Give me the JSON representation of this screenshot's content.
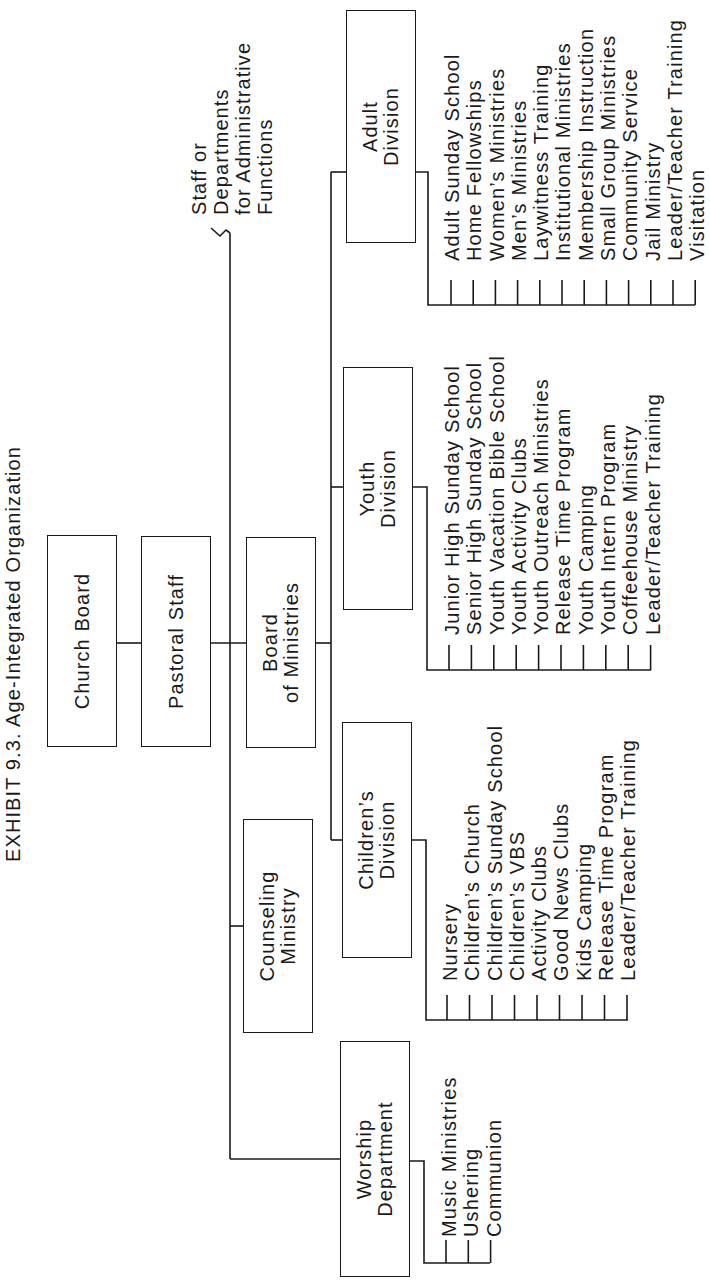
{
  "title": "EXHIBIT 9.3.  Age-Integrated Organization",
  "nodes": {
    "church_board": {
      "label": "Church Board"
    },
    "pastoral_staff": {
      "label": "Pastoral Staff"
    },
    "board_of_ministries": {
      "label": "Board\nof Ministries"
    },
    "staff_note": {
      "lines": [
        "Staff or",
        "Departments",
        "for Administrative",
        "Functions"
      ]
    },
    "counseling_ministry": {
      "label": "Counseling\nMinistry"
    },
    "worship_department": {
      "label": "Worship\nDepartment"
    },
    "childrens_division": {
      "label": "Children’s\nDivision"
    },
    "youth_division": {
      "label": "Youth\nDivision"
    },
    "adult_division": {
      "label": "Adult\nDivision"
    }
  },
  "lists": {
    "worship": [
      "Music Ministries",
      "Ushering",
      "Communion"
    ],
    "childrens": [
      "Nursery",
      "Children’s Church",
      "Children’s Sunday School",
      "Children’s VBS",
      "Activity Clubs",
      "Good News Clubs",
      "Kids Camping",
      "Release Time Program",
      "Leader/Teacher Training"
    ],
    "youth": [
      "Junior High Sunday School",
      "Senior High Sunday School",
      "Youth Vacation Bible School",
      "Youth Activity Clubs",
      "Youth Outreach Ministries",
      "Release Time Program",
      "Youth Camping",
      "Youth Intern Program",
      "Coffeehouse Ministry",
      "Leader/Teacher Training"
    ],
    "adult": [
      "Adult Sunday School",
      "Home Fellowships",
      "Women’s Ministries",
      "Men’s Ministries",
      "Laywitness Training",
      "Institutional Ministries",
      "Membership Instruction",
      "Small Group Ministries",
      "Community Service",
      "Jail Ministry",
      "Leader/Teacher Training",
      "Visitation"
    ]
  },
  "colors": {
    "ink": "#1a1a1a",
    "background": "#ffffff"
  },
  "orientation": "rotated 90° counter-clockwise"
}
